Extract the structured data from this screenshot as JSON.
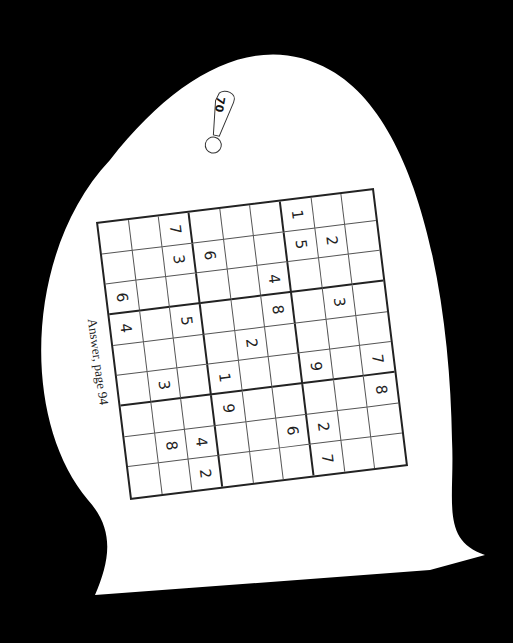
{
  "puzzle": {
    "number": "70",
    "answer_note": "Answer, page 94",
    "grid": [
      [
        "",
        "",
        "7",
        "",
        "",
        "",
        "1",
        "",
        ""
      ],
      [
        "",
        "",
        "3",
        "6",
        "",
        "",
        "5",
        "2",
        ""
      ],
      [
        "6",
        "",
        "",
        "",
        "",
        "4",
        "",
        "",
        ""
      ],
      [
        "4",
        "",
        "5",
        "",
        "",
        "8",
        "",
        "3",
        ""
      ],
      [
        "",
        "",
        "",
        "",
        "2",
        "",
        "",
        "",
        ""
      ],
      [
        "",
        "3",
        "",
        "1",
        "",
        "",
        "9",
        "",
        "7"
      ],
      [
        "",
        "",
        "",
        "9",
        "",
        "",
        "",
        "",
        "8"
      ],
      [
        "",
        "8",
        "4",
        "",
        "",
        "6",
        "2",
        "",
        ""
      ],
      [
        "",
        "",
        "2",
        "",
        "",
        "",
        "7",
        "",
        ""
      ]
    ]
  },
  "colors": {
    "background": "#000000",
    "paper": "#ffffff",
    "ink": "#222222"
  }
}
